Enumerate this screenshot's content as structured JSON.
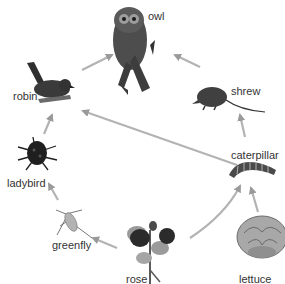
{
  "diagram": {
    "type": "food web",
    "nodes": [
      {
        "id": "owl",
        "label": "owl"
      },
      {
        "id": "robin",
        "label": "robin"
      },
      {
        "id": "shrew",
        "label": "shrew"
      },
      {
        "id": "caterpillar",
        "label": "caterpillar"
      },
      {
        "id": "ladybird",
        "label": "ladybird"
      },
      {
        "id": "greenfly",
        "label": "greenfly"
      },
      {
        "id": "rose",
        "label": "rose"
      },
      {
        "id": "lettuce",
        "label": "lettuce"
      }
    ],
    "edges": [
      {
        "from": "robin",
        "to": "owl"
      },
      {
        "from": "shrew",
        "to": "owl"
      },
      {
        "from": "caterpillar",
        "to": "shrew"
      },
      {
        "from": "caterpillar",
        "to": "robin"
      },
      {
        "from": "ladybird",
        "to": "robin"
      },
      {
        "from": "greenfly",
        "to": "ladybird"
      },
      {
        "from": "rose",
        "to": "greenfly"
      },
      {
        "from": "rose",
        "to": "caterpillar"
      },
      {
        "from": "lettuce",
        "to": "caterpillar"
      }
    ],
    "colors": {
      "arrow": "#a9a9a9",
      "label": "#333333",
      "background": "#ffffff"
    }
  }
}
